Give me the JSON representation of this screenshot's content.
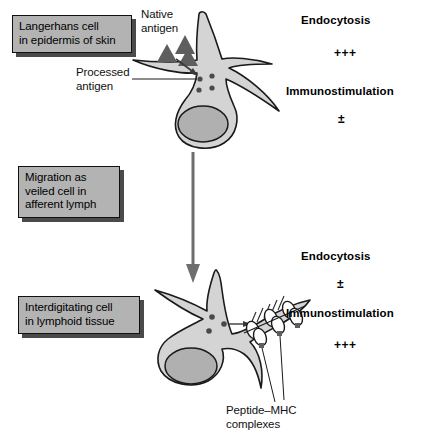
{
  "diagram": {
    "colors": {
      "cell_fill": "#d4d4d4",
      "nucleus_fill": "#b0b0b0",
      "outline": "#1a1a1a",
      "label_box_fill": "#b3b3b3",
      "label_box_shadow": "#4a4a4a",
      "antigen_triangle": "#5e5e5e",
      "antigen_dot": "#4a4a4a",
      "arrow": "#6e6e6e",
      "background": "#ffffff"
    }
  },
  "stage_labels": {
    "langerhans": "Langerhans cell\nin epidermis of skin",
    "migration": "Migration as\nveiled cell in\nafferent lymph",
    "interdigitating": "Interdigitating cell\nin lymphoid tissue"
  },
  "annotations": {
    "native_antigen": "Native\nantigen",
    "processed_antigen": "Processed\nantigen",
    "peptide_mhc": "Peptide–MHC\ncomplexes"
  },
  "top_cell_status": {
    "endocytosis_label": "Endocytosis",
    "endocytosis_value": "+++",
    "immunostimulation_label": "Immunostimulation",
    "immunostimulation_value": "±"
  },
  "bottom_cell_status": {
    "endocytosis_label": "Endocytosis",
    "endocytosis_value": "±",
    "immunostimulation_label": "Immunostimulation",
    "immunostimulation_value": "+++"
  },
  "icons": {
    "native_antigen_triangle": "triangle-icon",
    "processed_antigen_dot": "dot-icon",
    "migration_arrow": "down-arrow-icon",
    "transport_arrow": "right-arrow-icon",
    "uptake_arrow": "uptake-arrow-icon",
    "mhc_complex": "mhc-loop-icon"
  }
}
